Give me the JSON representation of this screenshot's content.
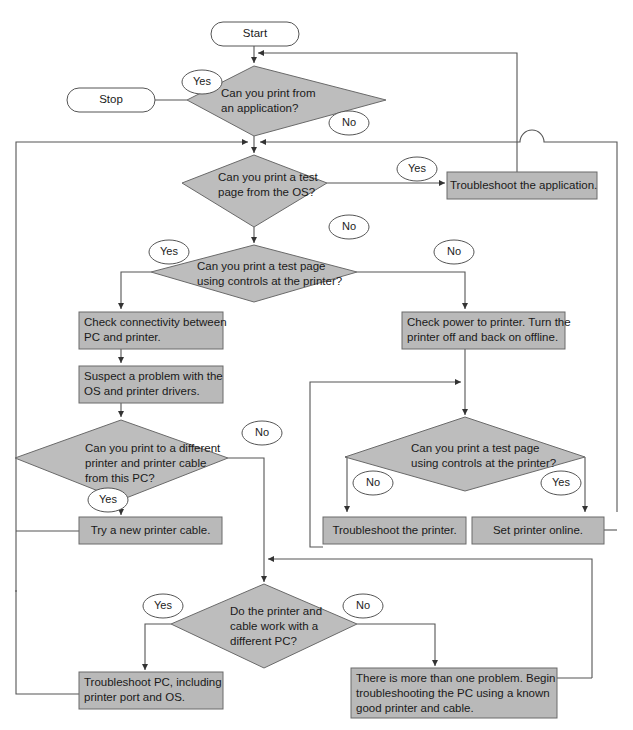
{
  "diagram": {
    "type": "flowchart",
    "colors": {
      "decision_fill": "#bdbdbd",
      "process_fill": "#b9b9b9",
      "line": "#555555",
      "background": "#ffffff"
    },
    "terminals": {
      "start": "Start",
      "stop": "Stop"
    },
    "decisions": [
      {
        "id": "d1",
        "text": "Can you print from\nan application?"
      },
      {
        "id": "d2",
        "text": "Can you print a test\npage from the OS?"
      },
      {
        "id": "d3",
        "text": "Can you print a test page\nusing controls at the printer?"
      },
      {
        "id": "d4",
        "text": "Can you print to a different\nprinter and printer cable\nfrom this PC?"
      },
      {
        "id": "d5",
        "text": "Can you print a test page\nusing controls at the printer?"
      },
      {
        "id": "d6",
        "text": "Do the printer and\ncable work with a\ndifferent PC?"
      }
    ],
    "processes": [
      {
        "id": "p1",
        "text": "Troubleshoot the application."
      },
      {
        "id": "p2",
        "text": "Check connectivity between\nPC and printer."
      },
      {
        "id": "p3",
        "text": "Check power to printer. Turn the\nprinter off and back on offline."
      },
      {
        "id": "p4",
        "text": "Suspect a problem with the\nOS and printer drivers."
      },
      {
        "id": "p5",
        "text": "Try a new printer cable."
      },
      {
        "id": "p6",
        "text": "Troubleshoot the printer."
      },
      {
        "id": "p7",
        "text": "Set printer online."
      },
      {
        "id": "p8",
        "text": "Troubleshoot PC, including\nprinter port and OS."
      },
      {
        "id": "p9",
        "text": "There is more than one problem. Begin\ntroubleshooting the PC using a known\ngood printer and cable."
      }
    ],
    "labels": {
      "d1_yes": "Yes",
      "d1_no": "No",
      "d2_yes": "Yes",
      "d2_no": "No",
      "d3_yes": "Yes",
      "d3_no": "No",
      "d4_yes": "Yes",
      "d4_no": "No",
      "d5_no": "No",
      "d5_yes": "Yes",
      "d6_yes": "Yes",
      "d6_no": "No"
    }
  }
}
